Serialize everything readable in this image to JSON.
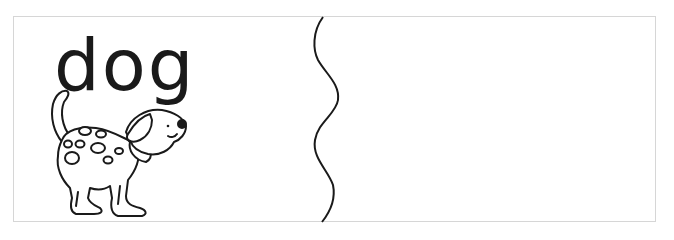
{
  "card": {
    "word": "dog",
    "picture": "dalmatian-dog-outline",
    "divider": "wavy-cut-line",
    "right_panel": ""
  },
  "colors": {
    "ink": "#1a1a1a",
    "border": "#d6d6d6",
    "background": "#ffffff"
  }
}
